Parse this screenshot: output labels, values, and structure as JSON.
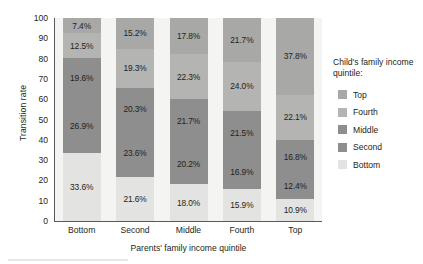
{
  "chart_data": {
    "type": "bar",
    "stacked": true,
    "title": "",
    "xlabel": "Parents' family income quintile",
    "ylabel": "Transition rate",
    "ylim": [
      0,
      100
    ],
    "yticks": [
      0,
      10,
      20,
      30,
      40,
      50,
      60,
      70,
      80,
      90,
      100
    ],
    "grid": false,
    "legend_position": "right",
    "legend_title": "Child's family income quintile:",
    "categories": [
      "Bottom",
      "Second",
      "Middle",
      "Fourth",
      "Top"
    ],
    "series": [
      {
        "name": "Bottom",
        "color": "#e3e3e1",
        "values": [
          33.6,
          21.6,
          18.0,
          15.9,
          10.9
        ],
        "labels": [
          "33.6%",
          "21.6%",
          "18.0%",
          "15.9%",
          "10.9%"
        ]
      },
      {
        "name": "Second",
        "color": "#8e8e8e",
        "values": [
          26.9,
          23.6,
          20.2,
          16.9,
          12.4
        ],
        "labels": [
          "26.9%",
          "23.6%",
          "20.2%",
          "16.9%",
          "12.4%"
        ]
      },
      {
        "name": "Middle",
        "color": "#8e8e8e",
        "values": [
          19.6,
          20.3,
          21.7,
          21.5,
          16.8
        ],
        "labels": [
          "19.6%",
          "20.3%",
          "21.7%",
          "21.5%",
          "16.8%"
        ]
      },
      {
        "name": "Fourth",
        "color": "#b4b4b2",
        "values": [
          12.5,
          19.3,
          22.3,
          24.0,
          22.1
        ],
        "labels": [
          "12.5%",
          "19.3%",
          "22.3%",
          "24.0%",
          "22.1%"
        ]
      },
      {
        "name": "Top",
        "color": "#a8a8a6",
        "values": [
          7.4,
          15.2,
          17.8,
          21.7,
          37.8
        ],
        "labels": [
          "7.4%",
          "15.2%",
          "17.8%",
          "21.7%",
          "37.8%"
        ]
      }
    ]
  },
  "legend": {
    "title": "Child's family income quintile:",
    "items": [
      {
        "label": "Top",
        "color": "#a8a8a6"
      },
      {
        "label": "Fourth",
        "color": "#b4b4b2"
      },
      {
        "label": "Middle",
        "color": "#8e8e8e"
      },
      {
        "label": "Second",
        "color": "#8e8e8e"
      },
      {
        "label": "Bottom",
        "color": "#e3e3e1"
      }
    ]
  },
  "axes": {
    "y_title": "Transition rate",
    "x_title": "Parents' family income quintile",
    "y_tick_labels": [
      "100",
      "90",
      "80",
      "70",
      "60",
      "50",
      "40",
      "30",
      "20",
      "10",
      "0"
    ],
    "x_tick_labels": [
      "Bottom",
      "Second",
      "Middle",
      "Fourth",
      "Top"
    ]
  },
  "colors": {
    "plot_background": "#f4f4f3",
    "axis": "#58595b",
    "text": "#231f20"
  }
}
